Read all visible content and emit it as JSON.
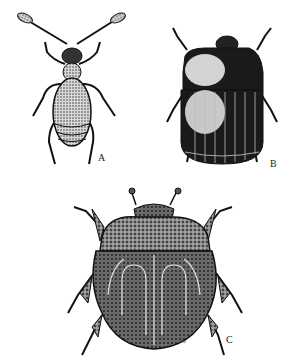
{
  "figure": {
    "panels": [
      {
        "id": "A",
        "label": "A",
        "subject": "slender beetle with long clubbed antennae, dorsal view"
      },
      {
        "id": "B",
        "label": "B",
        "subject": "oval dark beetle with striated elytra, dorsal view"
      },
      {
        "id": "C",
        "label": "C",
        "subject": "round stippled beetle with spiny legs, dorsal view"
      }
    ],
    "signature": "TM",
    "colors": {
      "ink": "#111111",
      "paper": "#ffffff",
      "stipple": "#6a6a6a"
    }
  }
}
